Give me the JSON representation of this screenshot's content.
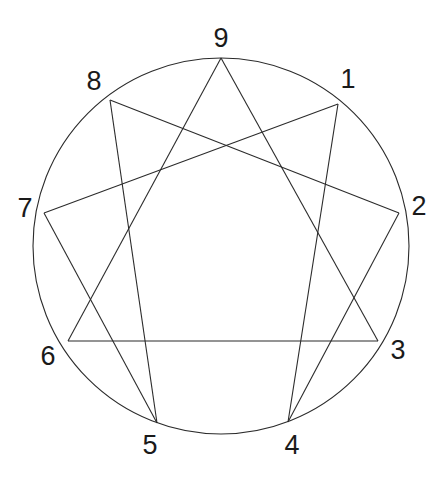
{
  "figure": {
    "name": "Enneagram",
    "background_color": "#ffffff",
    "stroke_color": "#2b2b2b",
    "label_color": "#1a1a1a",
    "stroke_width": 1.1,
    "circle": {
      "cx": 221,
      "cy": 246,
      "r": 188
    }
  },
  "chart_data": {
    "type": "diagram",
    "xlabel": "",
    "ylabel": "",
    "nodes": [
      {
        "id": "1",
        "label": "1",
        "angle_deg": 50,
        "x": 338,
        "y": 104,
        "label_x": 348,
        "label_y": 79
      },
      {
        "id": "2",
        "label": "2",
        "angle_deg": 10,
        "x": 399,
        "y": 213,
        "label_x": 419,
        "label_y": 206
      },
      {
        "id": "3",
        "label": "3",
        "angle_deg": -30,
        "x": 378,
        "y": 341,
        "label_x": 398,
        "label_y": 350
      },
      {
        "id": "4",
        "label": "4",
        "angle_deg": -70,
        "x": 288,
        "y": 422,
        "label_x": 292,
        "label_y": 445
      },
      {
        "id": "5",
        "label": "5",
        "angle_deg": -110,
        "x": 157,
        "y": 423,
        "label_x": 150,
        "label_y": 445
      },
      {
        "id": "6",
        "label": "6",
        "angle_deg": -150,
        "x": 68,
        "y": 341,
        "label_x": 48,
        "label_y": 356
      },
      {
        "id": "7",
        "label": "7",
        "angle_deg": 170,
        "x": 44,
        "y": 213,
        "label_x": 25,
        "label_y": 208
      },
      {
        "id": "8",
        "label": "8",
        "angle_deg": 130,
        "x": 110,
        "y": 100,
        "label_x": 94,
        "label_y": 81
      },
      {
        "id": "9",
        "label": "9",
        "angle_deg": 90,
        "x": 221,
        "y": 58,
        "label_x": 221,
        "label_y": 38
      }
    ],
    "edges": [
      {
        "from": "9",
        "to": "3",
        "group": "triangle"
      },
      {
        "from": "3",
        "to": "6",
        "group": "triangle"
      },
      {
        "from": "6",
        "to": "9",
        "group": "triangle"
      },
      {
        "from": "1",
        "to": "4",
        "group": "hexad"
      },
      {
        "from": "4",
        "to": "2",
        "group": "hexad"
      },
      {
        "from": "2",
        "to": "8",
        "group": "hexad"
      },
      {
        "from": "8",
        "to": "5",
        "group": "hexad"
      },
      {
        "from": "5",
        "to": "7",
        "group": "hexad"
      },
      {
        "from": "7",
        "to": "1",
        "group": "hexad"
      }
    ],
    "legend": [],
    "annotations": []
  }
}
